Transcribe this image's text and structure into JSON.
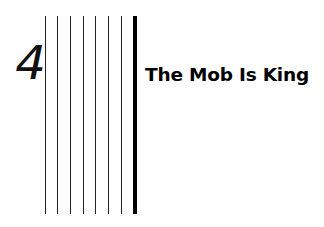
{
  "chapter": {
    "number": "4",
    "title": "The Mob Is King"
  },
  "decoration": {
    "thin_rules_x": [
      45,
      57,
      70,
      83,
      95,
      108,
      121
    ],
    "thick_rule_x": 133,
    "rule_color": "#000000"
  }
}
